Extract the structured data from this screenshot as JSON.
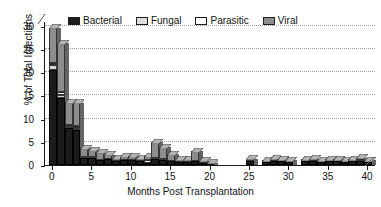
{
  "chart_data": {
    "type": "bar",
    "stacked": true,
    "title": "",
    "xlabel": "Months Post Transplantation",
    "ylabel": "% of Total Infections",
    "xlim": [
      -1,
      41
    ],
    "ylim": [
      0,
      31
    ],
    "xticks": [
      0,
      5,
      10,
      15,
      20,
      25,
      30,
      35,
      40
    ],
    "yticks": [
      0,
      5,
      10,
      15,
      20,
      25,
      30
    ],
    "grid": "horizontal-dotted",
    "legend_position": "top-center",
    "legend": [
      "Bacterial",
      "Fungal",
      "Parasitic",
      "Viral"
    ],
    "colors": {
      "Bacterial": "#1c1c1c",
      "Fungal": "#d8d8d8",
      "Parasitic": "#ffffff",
      "Viral": "#8d8d8d"
    },
    "categories": [
      0,
      1,
      2,
      3,
      4,
      5,
      6,
      7,
      8,
      9,
      10,
      11,
      12,
      13,
      14,
      15,
      16,
      17,
      18,
      19,
      20,
      21,
      22,
      23,
      24,
      25,
      26,
      27,
      28,
      29,
      30,
      31,
      32,
      33,
      34,
      35,
      36,
      37,
      38,
      39,
      40
    ],
    "series": [
      {
        "name": "Bacterial",
        "values": [
          20.5,
          14.5,
          8.0,
          7.5,
          1.5,
          1.5,
          1.0,
          1.2,
          0.8,
          1.0,
          1.0,
          0.8,
          0.5,
          1.3,
          1.0,
          0.8,
          0.6,
          0.6,
          0.8,
          0.4,
          0.3,
          0,
          0,
          0,
          0,
          0.9,
          0,
          0.7,
          0.9,
          0.8,
          0.7,
          0,
          0.8,
          0.9,
          0.6,
          0.8,
          0.9,
          0.6,
          0.8,
          0.9,
          0.7
        ]
      },
      {
        "name": "Fungal",
        "values": [
          1.0,
          0.6,
          0.4,
          0.5,
          0.3,
          0.2,
          0,
          0,
          0,
          0,
          0,
          0,
          0,
          0.3,
          0.2,
          0,
          0,
          0,
          0,
          0,
          0,
          0,
          0,
          0,
          0,
          0,
          0,
          0,
          0,
          0,
          0,
          0,
          0,
          0,
          0,
          0,
          0,
          0,
          0,
          0.2,
          0
        ]
      },
      {
        "name": "Parasitic",
        "values": [
          0.5,
          0.6,
          0.3,
          0.4,
          0,
          0,
          0,
          0,
          0,
          0,
          0,
          0,
          0.6,
          0,
          0,
          0,
          0,
          0,
          0,
          0,
          0,
          0,
          0,
          0,
          0,
          0,
          0,
          0,
          0,
          0,
          0,
          0,
          0,
          0,
          0,
          0,
          0,
          0,
          0,
          0,
          0
        ]
      },
      {
        "name": "Viral",
        "values": [
          7.5,
          10.5,
          4.8,
          5.0,
          1.8,
          1.5,
          1.6,
          1.0,
          0.6,
          0.8,
          0.9,
          0.6,
          0.8,
          3.3,
          2.6,
          1.5,
          0.5,
          0.5,
          2.2,
          0.5,
          0.2,
          0,
          0,
          0,
          0,
          0.4,
          0,
          0.3,
          0.4,
          0.3,
          0.3,
          0,
          0.3,
          0.4,
          0.3,
          0.3,
          0.3,
          0.3,
          0.3,
          0.5,
          0.3
        ]
      }
    ]
  },
  "axes": {
    "y_label": "% of Total Infections",
    "x_label": "Months Post Transplantation",
    "y_ticks": [
      "0",
      "5",
      "10",
      "15",
      "20",
      "25",
      "30"
    ],
    "x_ticks": [
      "0",
      "5",
      "10",
      "15",
      "20",
      "25",
      "30",
      "35",
      "40"
    ]
  },
  "legend": {
    "items": [
      {
        "label": "Bacterial",
        "key": "bacterial"
      },
      {
        "label": "Fungal",
        "key": "fungal"
      },
      {
        "label": "Parasitic",
        "key": "parasitic"
      },
      {
        "label": "Viral",
        "key": "viral"
      }
    ]
  }
}
